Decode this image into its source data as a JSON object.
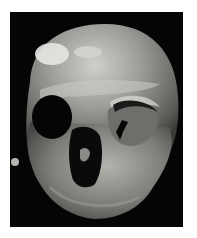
{
  "image": {
    "subject": "skull photograph",
    "background_color": "#ffffff",
    "photo_background": "#050505",
    "bone_tones": [
      "#d8d8d4",
      "#a9a9a4",
      "#7b7b77",
      "#4e4e4b"
    ]
  }
}
